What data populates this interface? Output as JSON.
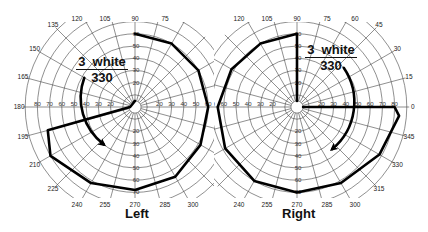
{
  "chart_data": {
    "type": "polar-visual-field",
    "charts": [
      {
        "eye": "Left",
        "stimulus": {
          "size": "3",
          "color": "white",
          "intensity": "330"
        },
        "angle_ticks": [
          0,
          15,
          30,
          45,
          60,
          75,
          90,
          105,
          120,
          135,
          150,
          165,
          180,
          195,
          210,
          225,
          240,
          255,
          270,
          285,
          300,
          315,
          330,
          345
        ],
        "visible_angle_labels": [
          "120",
          "105",
          "90",
          "75",
          "135",
          "150",
          "165",
          "180",
          "195",
          "210",
          "225",
          "240",
          "255",
          "270",
          "285",
          "300"
        ],
        "eccentricity_rings_deg": [
          10,
          20,
          30,
          40,
          50,
          60,
          70,
          80,
          90
        ],
        "horizontal_labels": [
          "80",
          "70",
          "60",
          "50",
          "40",
          "30",
          "20",
          "20",
          "30",
          "40",
          "50",
          "60"
        ],
        "vertical_labels": [
          "60",
          "50",
          "40",
          "30",
          "20",
          "10",
          "10",
          "20",
          "30",
          "40",
          "50",
          "60",
          "70"
        ],
        "isopter_path_deg": [
          {
            "angle": 90,
            "ecc": 60
          },
          {
            "angle": 60,
            "ecc": 60
          },
          {
            "angle": 30,
            "ecc": 60
          },
          {
            "angle": 0,
            "ecc": 60
          },
          {
            "angle": -30,
            "ecc": 62
          },
          {
            "angle": -60,
            "ecc": 66
          },
          {
            "angle": -90,
            "ecc": 68
          },
          {
            "angle": -120,
            "ecc": 72
          },
          {
            "angle": -150,
            "ecc": 80
          },
          {
            "angle": -165,
            "ecc": 74
          },
          {
            "angle": 180,
            "ecc": 4
          },
          {
            "angle": 90,
            "ecc": 5
          }
        ],
        "spiral_arrow": {
          "start": {
            "angle": 150,
            "ecc": 48
          },
          "end": {
            "angle": 230,
            "ecc": 40
          },
          "direction": "counterclockwise-down"
        }
      },
      {
        "eye": "Right",
        "stimulus": {
          "size": "3",
          "color": "white",
          "intensity": "330"
        },
        "visible_angle_labels": [
          "120",
          "105",
          "90",
          "75",
          "60",
          "45",
          "30",
          "15",
          "0",
          "345",
          "330",
          "315",
          "240",
          "255",
          "270",
          "285",
          "300"
        ],
        "eccentricity_rings_deg": [
          10,
          20,
          30,
          40,
          50,
          60,
          70,
          80,
          90
        ],
        "horizontal_labels": [
          "60",
          "50",
          "40",
          "30",
          "20",
          "20",
          "30",
          "40",
          "50",
          "60",
          "70",
          "80"
        ],
        "vertical_labels": [
          "60",
          "50",
          "40",
          "30",
          "20",
          "10",
          "10",
          "20",
          "30",
          "40",
          "50",
          "60",
          "70"
        ],
        "isopter_path_deg": [
          {
            "angle": 90,
            "ecc": 5
          },
          {
            "angle": 90,
            "ecc": 60
          },
          {
            "angle": 120,
            "ecc": 60
          },
          {
            "angle": 150,
            "ecc": 62
          },
          {
            "angle": 180,
            "ecc": 65
          },
          {
            "angle": 210,
            "ecc": 68
          },
          {
            "angle": 240,
            "ecc": 70
          },
          {
            "angle": 270,
            "ecc": 70
          },
          {
            "angle": 300,
            "ecc": 72
          },
          {
            "angle": 330,
            "ecc": 78
          },
          {
            "angle": 355,
            "ecc": 84
          },
          {
            "angle": 0,
            "ecc": 80
          },
          {
            "angle": 0,
            "ecc": 5
          }
        ],
        "spiral_arrow": {
          "start": {
            "angle": 40,
            "ecc": 50
          },
          "end": {
            "angle": 310,
            "ecc": 45
          },
          "direction": "clockwise-down"
        }
      }
    ]
  },
  "labels": {
    "left_eye": "Left",
    "right_eye": "Right",
    "left_stim_top": "3  white",
    "left_stim_bottom": "330",
    "right_stim_top": "3  white",
    "right_stim_bottom": "330"
  }
}
